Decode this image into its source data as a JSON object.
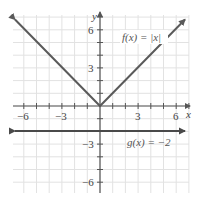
{
  "chart_data": {
    "type": "line",
    "title": "",
    "xlabel": "x",
    "ylabel": "y",
    "xlim": [
      -7,
      7
    ],
    "ylim": [
      -7,
      7
    ],
    "grid": true,
    "x_ticks": [
      -6,
      -3,
      3,
      6
    ],
    "y_ticks": [
      6,
      3,
      -3,
      -6
    ],
    "x_tick_labels": [
      "−6",
      "−3",
      "3",
      "6"
    ],
    "y_tick_labels": [
      "6",
      "3",
      "−3",
      "−6"
    ],
    "series": [
      {
        "name": "f(x) = |x|",
        "label": "f(x) = |x|",
        "x": [
          -6.8,
          0,
          6.8
        ],
        "y": [
          6.8,
          0,
          6.8
        ],
        "color": "#555555",
        "arrows": "both"
      },
      {
        "name": "g(x) = −2",
        "label": "g(x) = −2",
        "x": [
          -6.8,
          6.8
        ],
        "y": [
          -2,
          -2
        ],
        "color": "#444444",
        "arrows": "both"
      }
    ]
  },
  "labels": {
    "x_axis": "x",
    "y_axis": "y",
    "f_label": "f(x) = |x|",
    "g_label": "g(x) = −2",
    "tick_x_neg6": "−6",
    "tick_x_neg3": "−3",
    "tick_x_3": "3",
    "tick_x_6": "6",
    "tick_y_6": "6",
    "tick_y_3": "3",
    "tick_y_neg3": "−3",
    "tick_y_neg6": "−6"
  },
  "colors": {
    "grid": "#e2e2e2",
    "axis": "#555555",
    "f_line": "#5a5a5a",
    "g_line": "#4a4a4a"
  }
}
